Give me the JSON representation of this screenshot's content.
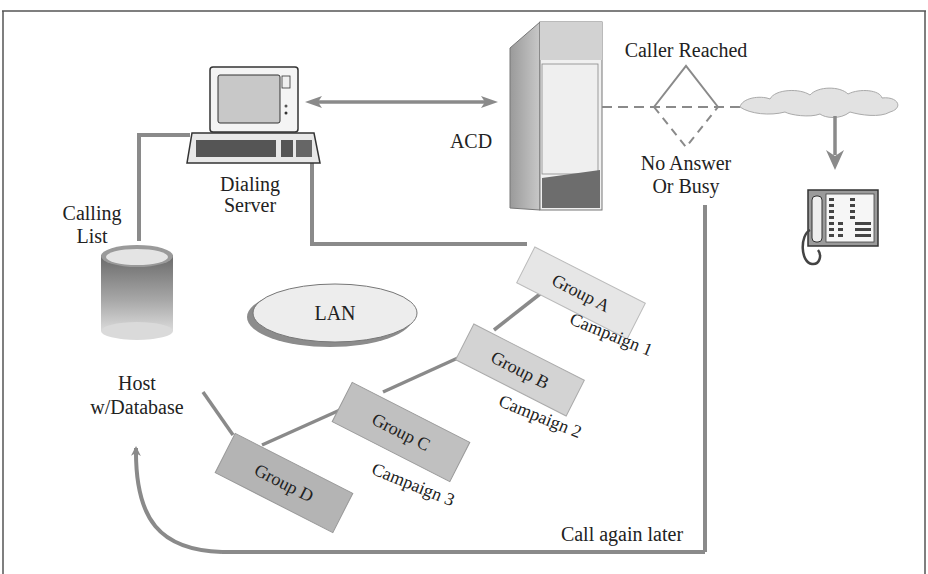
{
  "diagram": {
    "labels": {
      "dialing_server_line1": "Dialing",
      "dialing_server_line2": "Server",
      "calling_list_line1": "Calling",
      "calling_list_line2": "List",
      "acd": "ACD",
      "caller_reached": "Caller Reached",
      "no_answer_line1": "No Answer",
      "no_answer_line2": "Or Busy",
      "lan": "LAN",
      "host_line1": "Host",
      "host_line2": "w/Database",
      "call_again_later": "Call again later"
    },
    "groups": [
      {
        "label": "Group A",
        "campaign": "Campaign 1"
      },
      {
        "label": "Group B",
        "campaign": "Campaign 2"
      },
      {
        "label": "Group C",
        "campaign": "Campaign 3"
      },
      {
        "label": "Group D",
        "campaign": ""
      }
    ],
    "colors": {
      "line": "#8a8a8a",
      "group_light": "#e6e6e6",
      "group_mid": "#c9c9c9",
      "group_dark": "#b0b0b0",
      "frame": "#555555"
    }
  }
}
